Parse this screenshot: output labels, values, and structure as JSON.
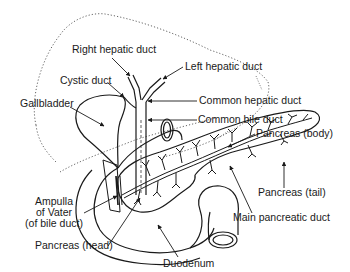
{
  "figure": {
    "line_color": "#1a1a1a",
    "dotted_color": "#555555",
    "background": "#ffffff"
  },
  "labels": {
    "right_hepatic_duct": "Right hepatic duct",
    "left_hepatic_duct": "Left hepatic duct",
    "cystic_duct": "Cystic duct",
    "gallbladder": "Gallbladder",
    "common_hepatic_duct": "Common hepatic duct",
    "common_bile_duct": "Common bile duct",
    "pancreas_body": "Pancreas (body)",
    "pancreas_tail": "Pancreas (tail)",
    "main_pancreatic_duct": "Main pancreatic duct",
    "ampulla_line1": "Ampulla",
    "ampulla_line2": "of Vater",
    "ampulla_line3": "(of bile duct)",
    "pancreas_head": "Pancreas (head)",
    "duodenum": "Duodenum"
  }
}
